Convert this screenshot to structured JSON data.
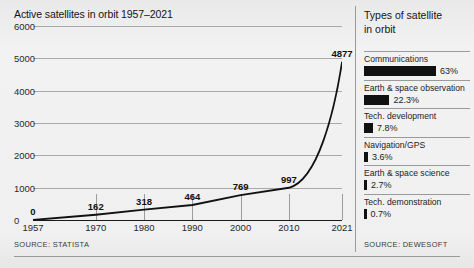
{
  "chart_data": {
    "type": "line",
    "title": "Active satellites in orbit 1957–2021",
    "xlabel": "",
    "ylabel": "",
    "ylim": [
      0,
      6000
    ],
    "grid": true,
    "legend_position": "none",
    "y_ticks": [
      "6000",
      "5000",
      "4000",
      "3000",
      "2000",
      "1000",
      "0"
    ],
    "y_tick_values": [
      6000,
      5000,
      4000,
      3000,
      2000,
      1000,
      0
    ],
    "x_ticks": [
      "1957",
      "1970",
      "1980",
      "1990",
      "2000",
      "2010",
      "2021"
    ],
    "x_tick_values": [
      1957,
      1970,
      1980,
      1990,
      2000,
      2010,
      2021
    ],
    "x": [
      1957,
      1970,
      1980,
      1990,
      2000,
      2010,
      2021
    ],
    "values": [
      0,
      162,
      318,
      464,
      769,
      997,
      4877
    ],
    "point_labels": [
      "0",
      "162",
      "318",
      "464",
      "769",
      "997",
      "4877"
    ],
    "series": [
      {
        "name": "Active satellites in orbit",
        "values": [
          0,
          162,
          318,
          464,
          769,
          997,
          4877
        ]
      }
    ],
    "line_color": "#111111",
    "source": "SOURCE: STATISTA"
  },
  "pie_data": {
    "type": "bar",
    "title": "Types of satellite in orbit",
    "categories": [
      "Communications",
      "Earth & space observation",
      "Tech. development",
      "Navigation/GPS",
      "Earth & space science",
      "Tech. demonstration"
    ],
    "values": [
      63,
      22.3,
      7.8,
      3.6,
      2.7,
      0.7
    ],
    "value_labels": [
      "63%",
      "22.3%",
      "7.8%",
      "3.6%",
      "2.7%",
      "0.7%"
    ],
    "bar_color": "#111111",
    "source": "SOURCE: DEWESOFT"
  },
  "chart": {
    "title": "Active satellites in orbit 1957–2021",
    "source": "SOURCE: STATISTA"
  },
  "legend": {
    "title_line1": "Types of satellite",
    "title_line2": "in orbit",
    "source": "SOURCE: DEWESOFT",
    "items": [
      {
        "label": "Communications",
        "pct": "63%",
        "value": 63
      },
      {
        "label": "Earth & space observation",
        "pct": "22.3%",
        "value": 22.3
      },
      {
        "label": "Tech. development",
        "pct": "7.8%",
        "value": 7.8
      },
      {
        "label": "Navigation/GPS",
        "pct": "3.6%",
        "value": 3.6
      },
      {
        "label": "Earth & space science",
        "pct": "2.7%",
        "value": 2.7
      },
      {
        "label": "Tech. demonstration",
        "pct": "0.7%",
        "value": 0.7
      }
    ]
  },
  "colors": {
    "ink": "#111111",
    "background": "#f0f0f0",
    "rule": "#9a9a9a"
  }
}
